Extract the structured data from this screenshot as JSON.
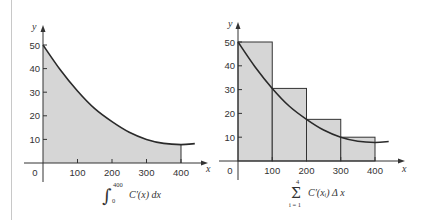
{
  "chart_data": [
    {
      "type": "area",
      "title": "",
      "caption": {
        "integral_upper": "400",
        "integral_lower": "0",
        "expression": "C′(x) dx"
      },
      "xlabel": "x",
      "ylabel": "y",
      "xticks": [
        "0",
        "100",
        "200",
        "300",
        "400"
      ],
      "yticks": [
        "10",
        "20",
        "30",
        "40",
        "50"
      ],
      "xlim": [
        0,
        440
      ],
      "ylim": [
        0,
        55
      ],
      "grid": false,
      "series": [
        {
          "name": "C'(x)",
          "x": [
            0,
            50,
            100,
            150,
            200,
            250,
            300,
            350,
            400,
            440
          ],
          "y": [
            50,
            39.5,
            30.5,
            23,
            17.5,
            13,
            10,
            8.3,
            7.8,
            8.2
          ]
        }
      ],
      "shaded_region": {
        "from": 0,
        "to": 400
      }
    },
    {
      "type": "bar",
      "title": "",
      "caption": {
        "sum_upper": "4",
        "sum_lower": "i = 1",
        "expression": "C′(xᵢ) Δ x"
      },
      "xlabel": "x",
      "ylabel": "y",
      "xticks": [
        "0",
        "100",
        "200",
        "300",
        "400"
      ],
      "yticks": [
        "10",
        "20",
        "30",
        "40",
        "50"
      ],
      "xlim": [
        0,
        440
      ],
      "ylim": [
        0,
        55
      ],
      "grid": false,
      "categories": [
        "0–100",
        "100–200",
        "200–300",
        "300–400"
      ],
      "values": [
        50,
        30.5,
        17.5,
        10
      ],
      "series": [
        {
          "name": "C'(x)",
          "x": [
            0,
            50,
            100,
            150,
            200,
            250,
            300,
            350,
            400,
            440
          ],
          "y": [
            50,
            39.5,
            30.5,
            23,
            17.5,
            13,
            10,
            8.3,
            7.8,
            8.2
          ]
        }
      ]
    }
  ],
  "colors": {
    "fill": "#d6d6d6",
    "curve": "#2a2a2a",
    "axis": "#333333"
  }
}
